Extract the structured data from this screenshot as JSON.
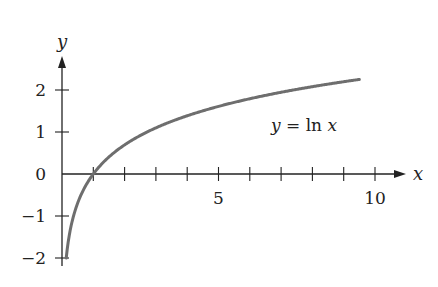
{
  "chart_data": {
    "type": "line",
    "title": "",
    "xlabel": "x",
    "ylabel": "y",
    "annotation": "y = ln x",
    "function": "ln(x)",
    "series": [
      {
        "name": "y = ln x",
        "color": "#6e6e6e",
        "x": [
          0.135,
          0.2,
          0.3,
          0.5,
          0.75,
          1,
          1.5,
          2,
          3,
          4,
          5,
          6,
          7,
          8,
          9,
          9.5
        ],
        "values": [
          -2.0,
          -1.61,
          -1.2,
          -0.69,
          -0.29,
          0,
          0.41,
          0.69,
          1.1,
          1.39,
          1.61,
          1.79,
          1.95,
          2.08,
          2.2,
          2.25
        ]
      }
    ],
    "x_ticks": [
      1,
      2,
      3,
      4,
      5,
      6,
      7,
      8,
      9,
      10
    ],
    "x_tick_labels": [
      {
        "value": 5,
        "label": "5"
      },
      {
        "value": 10,
        "label": "10"
      }
    ],
    "y_ticks": [
      -2,
      -1,
      1,
      2
    ],
    "y_tick_labels": [
      {
        "value": 2,
        "label": "2"
      },
      {
        "value": 1,
        "label": "1"
      },
      {
        "value": 0,
        "label": "0"
      },
      {
        "value": -1,
        "label": "−1"
      },
      {
        "value": -2,
        "label": "−2"
      }
    ],
    "xlim": [
      0,
      10.9
    ],
    "ylim": [
      -2.2,
      2.8
    ],
    "grid": false,
    "legend": "none",
    "axis_color": "#222222",
    "curve_color": "#6e6e6e"
  }
}
